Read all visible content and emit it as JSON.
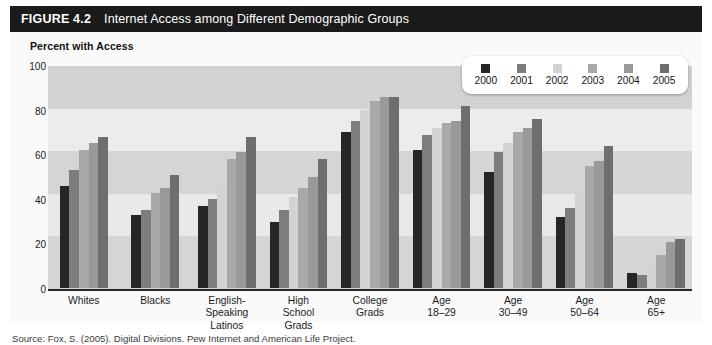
{
  "figure": {
    "number": "FIGURE 4.2",
    "title": "Internet Access among Different Demographic Groups",
    "y_caption": "Percent with Access",
    "source": "Source: Fox, S. (2005). Digital Divisions. Pew Internet and American Life Project."
  },
  "legend": {
    "items": [
      {
        "label": "2000",
        "color": "#262626"
      },
      {
        "label": "2001",
        "color": "#7d7d7d"
      },
      {
        "label": "2002",
        "color": "#d3d3d3"
      },
      {
        "label": "2003",
        "color": "#a8a8a8"
      },
      {
        "label": "2004",
        "color": "#999999"
      },
      {
        "label": "2005",
        "color": "#6e6e6e"
      }
    ]
  },
  "axis": {
    "y_ticks": [
      "0",
      "20",
      "40",
      "60",
      "80",
      "100"
    ]
  },
  "chart_data": {
    "type": "bar",
    "title": "Internet Access among Different Demographic Groups",
    "xlabel": "",
    "ylabel": "Percent with Access",
    "ylim": [
      0,
      100
    ],
    "ytick_step": 20,
    "grid": "horizontal-bands",
    "legend_position": "top-right",
    "categories": [
      "Whites",
      "Blacks",
      "English-\nSpeaking\nLatinos",
      "High\nSchool\nGrads",
      "College\nGrads",
      "Age\n18–29",
      "Age\n30–49",
      "Age\n50–64",
      "Age\n65+"
    ],
    "series": [
      {
        "name": "2000",
        "color": "#262626",
        "values": [
          46,
          33,
          37,
          30,
          70,
          62,
          52,
          32,
          7
        ]
      },
      {
        "name": "2001",
        "color": "#7d7d7d",
        "values": [
          53,
          35,
          40,
          35,
          75,
          69,
          61,
          36,
          6
        ]
      },
      {
        "name": "2002",
        "color": "#d3d3d3",
        "values": [
          null,
          null,
          47,
          41,
          80,
          72,
          65,
          43,
          12
        ]
      },
      {
        "name": "2003",
        "color": "#a8a8a8",
        "values": [
          62,
          43,
          58,
          45,
          84,
          74,
          70,
          55,
          15
        ]
      },
      {
        "name": "2004",
        "color": "#999999",
        "values": [
          65,
          45,
          61,
          50,
          86,
          75,
          72,
          57,
          21
        ]
      },
      {
        "name": "2005",
        "color": "#6e6e6e",
        "values": [
          68,
          51,
          68,
          58,
          86,
          82,
          76,
          64,
          22
        ]
      }
    ]
  }
}
